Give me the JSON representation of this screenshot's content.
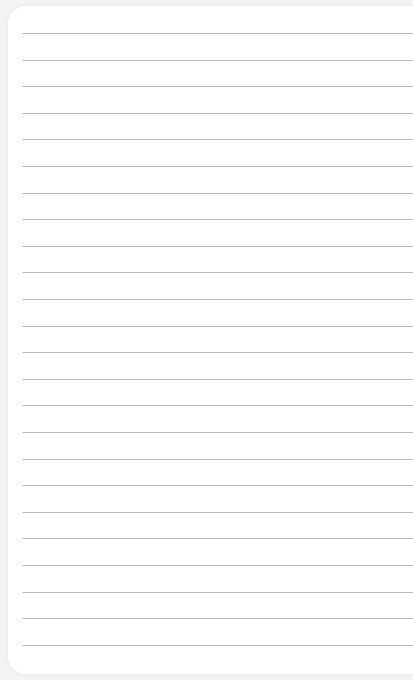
{
  "image": {
    "subject": "blank lined notebook paper",
    "background_color": "#f4f4f4",
    "paper_color": "#ffffff",
    "rule_color": "#b9b9b9",
    "rule_count": 24,
    "first_rule_y": 33,
    "rule_spacing_px": 26.6
  }
}
